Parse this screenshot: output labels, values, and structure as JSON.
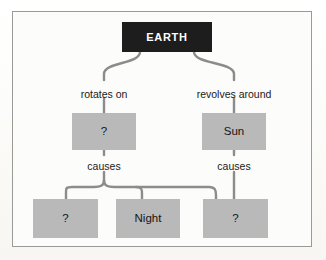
{
  "diagram": {
    "colors": {
      "dark_node": "#1d1d1d",
      "gray_node": "#b9b9b9",
      "connector": "#8c8c8c",
      "frame": "#9a9a98",
      "paper": "#fcfcfa",
      "dark_node_text": "#ffffff",
      "gray_node_text": "#151515"
    },
    "nodes": [
      {
        "id": "earth",
        "label": "EARTH",
        "style": "dark",
        "x": 122,
        "y": 22,
        "w": 90,
        "h": 30
      },
      {
        "id": "axis",
        "label": "?",
        "style": "gray",
        "x": 72,
        "y": 113,
        "w": 64,
        "h": 37
      },
      {
        "id": "sun",
        "label": "Sun",
        "style": "gray",
        "x": 202,
        "y": 113,
        "w": 64,
        "h": 37
      },
      {
        "id": "day",
        "label": "?",
        "style": "gray",
        "x": 33,
        "y": 199,
        "w": 65,
        "h": 39
      },
      {
        "id": "night",
        "label": "Night",
        "style": "gray",
        "x": 116,
        "y": 199,
        "w": 64,
        "h": 39
      },
      {
        "id": "seasons",
        "label": "?",
        "style": "gray",
        "x": 203,
        "y": 199,
        "w": 65,
        "h": 39
      }
    ],
    "edge_labels": [
      {
        "id": "rotates-on",
        "text": "rotates on",
        "x": 68,
        "y": 88,
        "w": 72
      },
      {
        "id": "revolves-around",
        "text": "revolves around",
        "x": 182,
        "y": 88,
        "w": 104
      },
      {
        "id": "causes-left",
        "text": "causes",
        "x": 80,
        "y": 161,
        "w": 48
      },
      {
        "id": "causes-right",
        "text": "causes",
        "x": 210,
        "y": 161,
        "w": 48
      }
    ],
    "relationships": [
      {
        "from": "earth",
        "label": "rotates on",
        "to": "axis"
      },
      {
        "from": "earth",
        "label": "revolves around",
        "to": "sun"
      },
      {
        "from": "axis",
        "label": "causes",
        "to": "day"
      },
      {
        "from": "axis",
        "label": "causes",
        "to": "night"
      },
      {
        "from": "axis",
        "label": "causes",
        "to": "seasons"
      },
      {
        "from": "sun",
        "label": "causes",
        "to": "seasons"
      }
    ]
  }
}
